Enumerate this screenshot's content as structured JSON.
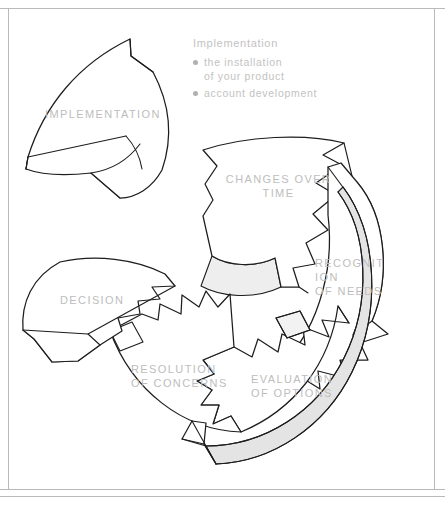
{
  "page": {
    "background_color": "#ffffff",
    "rule_color": "#b9b9b9",
    "ink_color": "#1d1d1d",
    "label_color": "#bdbdbd",
    "shade_color": "#eeeeee"
  },
  "diagram": {
    "type": "cycle-diagram",
    "segments": [
      {
        "id": "implementation",
        "label": "IMPLEMENTATION",
        "state": "detached",
        "position": "top-left"
      },
      {
        "id": "changes-over-time",
        "label": "CHANGES OVER\nTIME",
        "state": "in-ring",
        "position": "top"
      },
      {
        "id": "recognition-of-needs",
        "label": "RECOGNIT\nION\nOF NEEDS",
        "state": "in-ring",
        "position": "right"
      },
      {
        "id": "evaluation-of-options",
        "label": "EVALUATION\nOF OPTIONS",
        "state": "in-ring",
        "position": "bottom-right"
      },
      {
        "id": "resolution-of-concerns",
        "label": "RESOLUTION\nOF CONCERNS",
        "state": "in-ring",
        "position": "bottom-left"
      },
      {
        "id": "decision",
        "label": "DECISION",
        "state": "in-ring",
        "position": "left"
      }
    ]
  },
  "callout": {
    "title": "Implementation",
    "items": [
      {
        "text": "the installation\nof your product"
      },
      {
        "text": "account development"
      }
    ]
  }
}
